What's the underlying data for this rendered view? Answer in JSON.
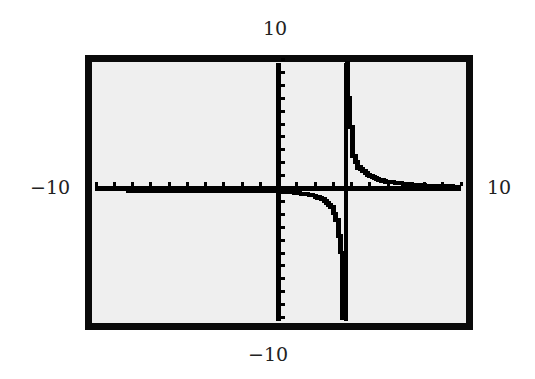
{
  "window": {
    "ymax_label": "10",
    "ymin_label": "−10",
    "xmin_label": "−10",
    "xmax_label": "10"
  },
  "colors": {
    "screen_bg": "#efefef",
    "ink": "#000000",
    "frame": "#0a0a0a"
  },
  "chart_data": {
    "type": "line",
    "title": "",
    "xlabel": "",
    "ylabel": "",
    "xlim": [
      -10,
      10
    ],
    "ylim": [
      -10,
      10
    ],
    "xscale_tick": 1,
    "yscale_tick": 1,
    "grid": false,
    "axes_labels": {
      "top": "10",
      "bottom": "-10",
      "left": "-10",
      "right": "10"
    },
    "vertical_asymptote_x": 3.7,
    "horizontal_asymptote_y": 0,
    "series": [
      {
        "name": "left branch",
        "x": [
          -10,
          -8,
          -6,
          -4,
          -2,
          0,
          1,
          2,
          2.5,
          3,
          3.3,
          3.5,
          3.6
        ],
        "y": [
          -0.07,
          -0.09,
          -0.1,
          -0.13,
          -0.18,
          -0.27,
          -0.37,
          -0.6,
          -0.85,
          -1.5,
          -2.5,
          -5,
          -10
        ]
      },
      {
        "name": "right branch",
        "x": [
          3.8,
          3.9,
          4.2,
          4.5,
          5,
          5.5,
          6,
          7,
          8,
          10
        ],
        "y": [
          10,
          7,
          2.5,
          1.6,
          1.0,
          0.7,
          0.5,
          0.3,
          0.2,
          0.1
        ]
      }
    ]
  }
}
